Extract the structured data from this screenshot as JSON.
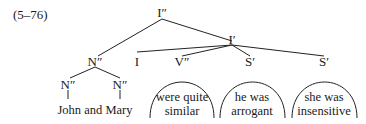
{
  "example_number": "(5–76)",
  "nodes": {
    "root": "I″",
    "ibar": "I′",
    "subject": "N″",
    "subject_left": "N″",
    "subject_right": "N″",
    "infl": "I",
    "vp": "V″",
    "s1": "S′",
    "s2": "S′"
  },
  "leaves": {
    "subject_text": "John and Mary",
    "vp_line1": "were quite",
    "vp_line2": "similar",
    "s1_line1": "he was",
    "s1_line2": "arrogant",
    "s2_line1": "she was",
    "s2_line2": "insensitive"
  }
}
